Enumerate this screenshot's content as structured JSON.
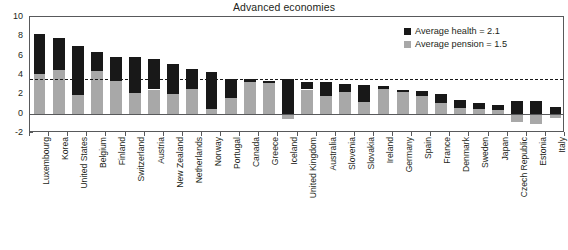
{
  "chart_data": {
    "type": "bar",
    "subtype": "stacked-bar",
    "title": "Advanced economies",
    "xlabel": "",
    "ylabel": "",
    "ylim": [
      -2,
      10
    ],
    "yticks": [
      -2,
      0,
      2,
      4,
      6,
      8,
      10
    ],
    "ytick_labels": [
      "-2",
      "0",
      "2",
      "4",
      "6",
      "8",
      "10"
    ],
    "grid": false,
    "legend_position": "top-right",
    "legend": [
      {
        "label": "Average health = 2.1",
        "color": "#181818",
        "key": "health"
      },
      {
        "label": "Average pension = 1.5",
        "color": "#a8a8a8",
        "key": "pension"
      }
    ],
    "reference_line": {
      "value": 3.6,
      "style": "dashed",
      "color": "#181818",
      "label": ""
    },
    "categories": [
      "Luxembourg",
      "Korea",
      "United States",
      "Belgium",
      "Finland",
      "Switzerland",
      "Austria",
      "New Zealand",
      "Netherlands",
      "Norway",
      "Portugal",
      "Canada",
      "Greece",
      "Iceland",
      "United Kingdom",
      "Australia",
      "Slovenia",
      "Slovakia",
      "Ireland",
      "Germany",
      "Spain",
      "France",
      "Denmark",
      "Sweden",
      "Japan",
      "Czech Republic",
      "Estonia",
      "Italy"
    ],
    "series": [
      {
        "name": "Average pension = 1.5",
        "key": "pension",
        "color": "#a8a8a8",
        "values": [
          4.1,
          4.5,
          1.9,
          4.4,
          3.4,
          2.1,
          2.5,
          2.0,
          2.6,
          0.5,
          1.6,
          3.3,
          3.2,
          -0.6,
          2.5,
          1.8,
          2.2,
          1.2,
          2.6,
          2.2,
          1.8,
          1.1,
          0.6,
          0.5,
          0.4,
          -0.9,
          -1.1,
          -0.4
        ]
      },
      {
        "name": "Average health = 2.1",
        "key": "health",
        "color": "#181818",
        "values": [
          4.1,
          3.3,
          5.1,
          2.0,
          2.5,
          3.8,
          3.2,
          3.1,
          2.0,
          3.8,
          2.0,
          0.3,
          0.2,
          3.6,
          0.8,
          1.5,
          0.9,
          1.8,
          0.3,
          0.3,
          0.5,
          0.9,
          0.8,
          0.6,
          0.5,
          1.3,
          1.3,
          0.7
        ]
      }
    ],
    "totals": [
      8.2,
      7.8,
      7.0,
      6.4,
      5.9,
      5.9,
      5.7,
      5.1,
      4.6,
      4.3,
      3.6,
      3.6,
      3.4,
      3.0,
      3.3,
      3.3,
      3.1,
      3.0,
      2.9,
      2.5,
      2.3,
      2.0,
      1.4,
      1.1,
      0.9,
      0.4,
      0.2,
      0.3
    ]
  },
  "bottom_caption": ""
}
